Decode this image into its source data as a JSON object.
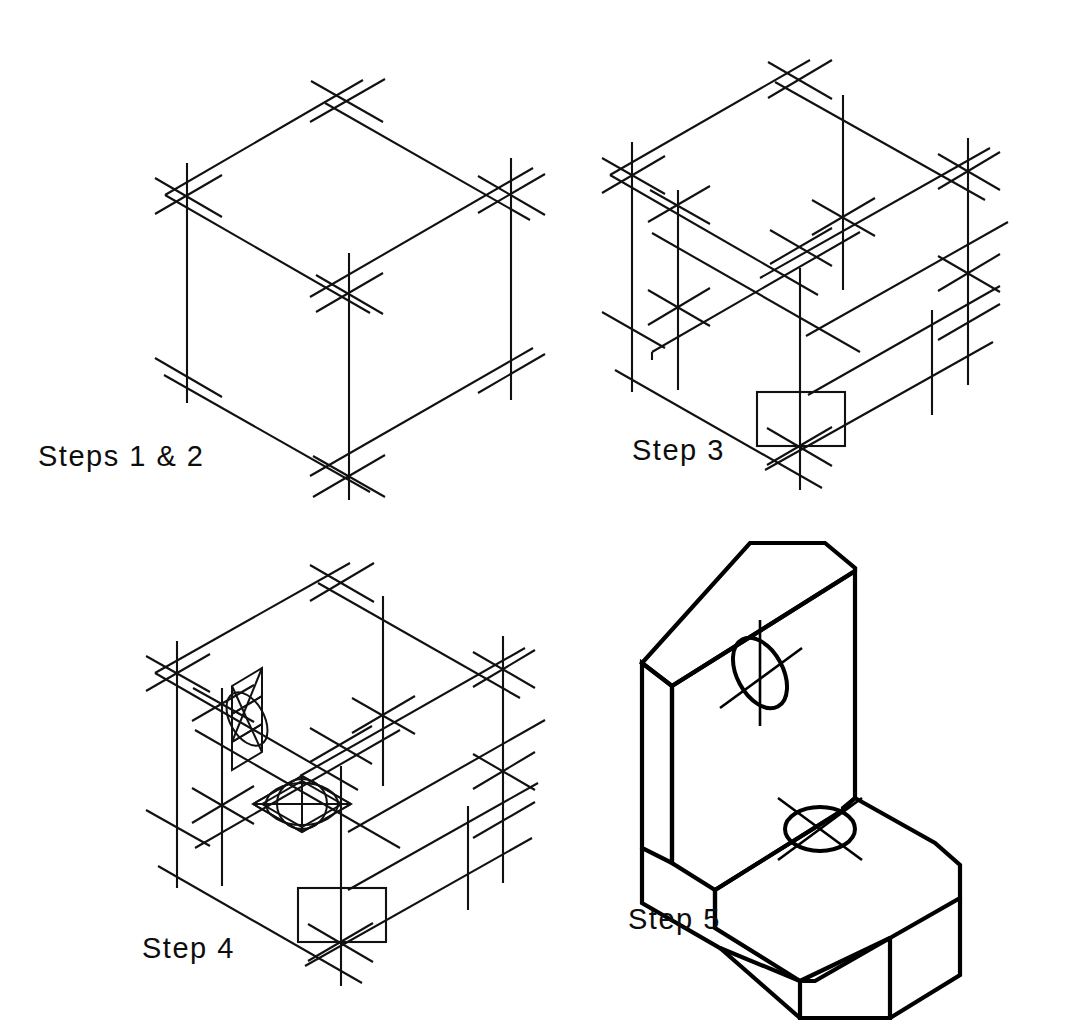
{
  "document": {
    "title": "Isometric Drawing Construction Steps",
    "background_color": "#ffffff",
    "line_color": "#111111",
    "page_width": 1065,
    "page_height": 1028
  },
  "panels": [
    {
      "id": "step12",
      "caption": "Steps  1  &  2",
      "description": "Isometric construction box: a cube drawn with light construction lines and crossed vertex marks at each corner.",
      "features": [
        "isometric-cube",
        "vertex-crosses",
        "construction-lines"
      ]
    },
    {
      "id": "step3",
      "caption": "Step  3",
      "description": "Construction box with the horizontal shelf plane and the front notch rectangle laid out using additional construction lines and vertex crosses.",
      "features": [
        "isometric-cube",
        "shelf-plane",
        "notch-rectangle",
        "vertex-crosses",
        "construction-lines"
      ]
    },
    {
      "id": "step4",
      "caption": "Step  4",
      "description": "Construction box with two four-center isometric ellipses blocked in: one on the vertical back face and one on the horizontal shelf face.",
      "features": [
        "isometric-cube",
        "shelf-plane",
        "notch-rectangle",
        "vertical-face-ellipse",
        "horizontal-face-ellipse",
        "four-center-construction",
        "vertex-crosses"
      ]
    },
    {
      "id": "step5",
      "caption": "Step  5",
      "description": "Finished L-shaped bracket in isometric with chamfered front corner, two through holes with center lines, drawn in heavy object lines.",
      "features": [
        "l-bracket-solid",
        "chamfered-corner",
        "vertical-hole",
        "horizontal-hole",
        "center-lines",
        "heavy-object-lines"
      ]
    }
  ],
  "icons": {
    "vertex_cross": "vertex-cross-icon",
    "ellipse": "ellipse-icon",
    "center_line": "center-line-icon"
  }
}
